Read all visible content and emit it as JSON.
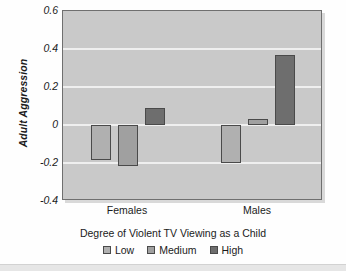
{
  "chart_data": {
    "type": "bar",
    "title": "",
    "xlabel": "Degree of Violent TV Viewing as a Child",
    "ylabel": "Adult Aggression",
    "categories": [
      "Females",
      "Males"
    ],
    "series": [
      {
        "name": "Low",
        "values": [
          -0.185,
          -0.2
        ],
        "color": "#b0b0b0"
      },
      {
        "name": "Medium",
        "values": [
          -0.215,
          0.03
        ],
        "color": "#a0a0a0"
      },
      {
        "name": "High",
        "values": [
          0.09,
          0.37
        ],
        "color": "#6e6e6e"
      }
    ],
    "ylim": [
      -0.4,
      0.6
    ],
    "ytick_values": [
      0.6,
      0.4,
      0.2,
      0,
      -0.2,
      -0.4
    ],
    "ytick_labels": [
      "0.6",
      "0.4",
      "0.2",
      "0",
      "-0.2",
      "-0.4"
    ],
    "grid": true,
    "gridlines_at": [
      0.4,
      0.2,
      0,
      -0.2
    ],
    "legend_position": "bottom",
    "plot_background": "#c9c9c9",
    "gridline_color": "#efefef",
    "bar_border_color": "#4a4a4a",
    "text_color": "#1b1b1b"
  }
}
